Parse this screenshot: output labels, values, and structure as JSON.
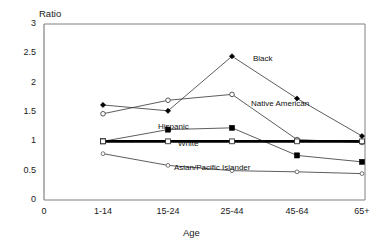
{
  "chart_data": {
    "type": "line",
    "title": "",
    "xlabel": "Age",
    "ylabel": "Ratio",
    "categories": [
      "1-14",
      "15-24",
      "25-44",
      "45-64",
      "65+"
    ],
    "xtick_labels": [
      "0",
      "1-14",
      "15-24",
      "25-44",
      "45-64",
      "65+"
    ],
    "ytick_labels": [
      "0",
      "0.5",
      "1",
      "1.5",
      "2",
      "2.5",
      "3"
    ],
    "ylim": [
      0,
      3
    ],
    "ytick_values": [
      0,
      0.5,
      1,
      1.5,
      2,
      2.5,
      3
    ],
    "grid": false,
    "legend_position": "inline-annotations",
    "series": [
      {
        "name": "Black",
        "marker": "filled-diamond",
        "values": [
          1.62,
          1.52,
          2.45,
          1.73,
          1.09
        ]
      },
      {
        "name": "Native American",
        "marker": "open-circle",
        "values": [
          1.47,
          1.7,
          1.8,
          1.03,
          0.98
        ]
      },
      {
        "name": "Hispanic",
        "marker": "filled-square",
        "values": [
          1.0,
          1.2,
          1.23,
          0.76,
          0.65
        ]
      },
      {
        "name": "White",
        "marker": "open-square",
        "values": [
          1.0,
          1.0,
          1.0,
          1.0,
          1.0
        ]
      },
      {
        "name": "Asian/Pacific Islander",
        "marker": "small-open-circle",
        "values": [
          0.79,
          0.59,
          0.5,
          0.48,
          0.45
        ]
      }
    ],
    "annotations": [
      {
        "text": "Black",
        "x": 253,
        "y": 54
      },
      {
        "text": "Native American",
        "x": 251,
        "y": 99
      },
      {
        "text": "Hispanic",
        "x": 158,
        "y": 122
      },
      {
        "text": "White",
        "x": 178,
        "y": 139
      },
      {
        "text": "Asian/Pacific Islander",
        "x": 174,
        "y": 163
      }
    ],
    "colors": {
      "axis": "#808080",
      "line": "#333333",
      "white_series": "#000000",
      "text": "#1a1a1a",
      "background": "#ffffff"
    }
  }
}
